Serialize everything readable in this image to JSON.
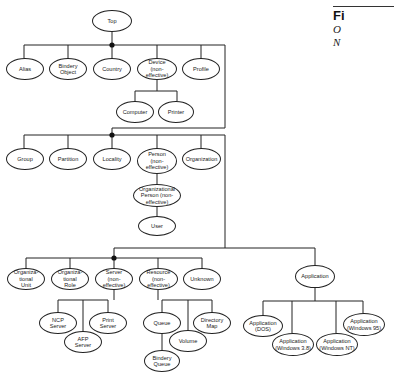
{
  "figure": {
    "label": "Fi",
    "caption_line1": "O",
    "caption_line2": "N"
  },
  "nodes": {
    "top": "Top",
    "alias": "Alias",
    "bindery_object": "Bindery\nObject",
    "country": "Country",
    "device": "Device\n(non-\neffective)",
    "profile": "Profile",
    "computer": "Computer",
    "printer": "Printer",
    "group": "Group",
    "partition": "Partition",
    "locality": "Locality",
    "person": "Person\n(non-\neffective)",
    "organization": "Organization",
    "org_person": "Organizational\nPerson (non-\neffective)",
    "user": "User",
    "org_unit": "Organiza-\ntional\nUnit",
    "org_role": "Organiza-\ntional\nRole",
    "server": "Server\n(non-\neffective)",
    "resource": "Resource\n(non-\neffective)",
    "unknown": "Unknown",
    "application": "Application",
    "ncp_server": "NCP\nServer",
    "afp_server": "AFP\nServer",
    "print_server": "Print\nServer",
    "queue": "Queue",
    "bindery_queue": "Bindery\nQueue",
    "volume": "Volume",
    "directory_map": "Directory\nMap",
    "app_dos": "Application\n(DOS)",
    "app_win31": "Application\n(Windows 3.8)",
    "app_winnt": "Application\n(Windows NT)",
    "app_win95": "Application\n(Windows 95)"
  }
}
